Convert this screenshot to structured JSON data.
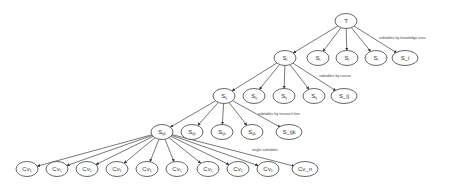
{
  "diagram": {
    "title": "",
    "root": {
      "id": "T",
      "label": "T",
      "x": 346,
      "y": 21
    },
    "levels": [
      {
        "annotation": "subtables by knowledge area",
        "annotation_pos": [
          379,
          39
        ],
        "parent": "T",
        "nodes": [
          {
            "id": "L1_0",
            "label": "S",
            "sub": "i",
            "x": 285,
            "y": 58
          },
          {
            "id": "L1_1",
            "label": "S",
            "sub": "i",
            "x": 318,
            "y": 58
          },
          {
            "id": "L1_2",
            "label": "S",
            "sub": "i",
            "x": 347,
            "y": 58
          },
          {
            "id": "L1_3",
            "label": "S",
            "sub": "i",
            "x": 376,
            "y": 58
          },
          {
            "id": "L1_4",
            "label": "S_i",
            "sub": "",
            "x": 405,
            "y": 58
          }
        ]
      },
      {
        "annotation": "subtables by course",
        "annotation_pos": [
          319,
          77
        ],
        "parent": "L1_0",
        "nodes": [
          {
            "id": "L2_0",
            "label": "S",
            "sub": "ij",
            "x": 224,
            "y": 96
          },
          {
            "id": "L2_1",
            "label": "S",
            "sub": "ij",
            "x": 254,
            "y": 96
          },
          {
            "id": "L2_2",
            "label": "S",
            "sub": "ij",
            "x": 284,
            "y": 96
          },
          {
            "id": "L2_3",
            "label": "S",
            "sub": "ij",
            "x": 314,
            "y": 96
          },
          {
            "id": "L2_4",
            "label": "S_ij",
            "sub": "",
            "x": 344,
            "y": 96
          }
        ]
      },
      {
        "annotation": "subtables by research line",
        "annotation_pos": [
          258,
          115
        ],
        "parent": "L2_0",
        "nodes": [
          {
            "id": "L3_0",
            "label": "S",
            "sub": "ijk",
            "x": 162,
            "y": 132
          },
          {
            "id": "L3_1",
            "label": "S",
            "sub": "ijk",
            "x": 192,
            "y": 132
          },
          {
            "id": "L3_2",
            "label": "S",
            "sub": "ijk",
            "x": 222,
            "y": 132
          },
          {
            "id": "L3_3",
            "label": "S",
            "sub": "ijk",
            "x": 252,
            "y": 132
          },
          {
            "id": "L3_4",
            "label": "S_ijk",
            "sub": "",
            "x": 289,
            "y": 132
          }
        ]
      },
      {
        "annotation": "single subtables",
        "annotation_pos": [
          252,
          151
        ],
        "parent": "L3_0",
        "nodes": [
          {
            "id": "L4_0",
            "label": "Cv",
            "sub": "1",
            "x": 27,
            "y": 169
          },
          {
            "id": "L4_1",
            "label": "Cv",
            "sub": "1",
            "x": 57,
            "y": 169
          },
          {
            "id": "L4_2",
            "label": "Cv",
            "sub": "1",
            "x": 87,
            "y": 169
          },
          {
            "id": "L4_3",
            "label": "Cv",
            "sub": "1",
            "x": 117,
            "y": 169
          },
          {
            "id": "L4_4",
            "label": "Cv",
            "sub": "1",
            "x": 147,
            "y": 169
          },
          {
            "id": "L4_5",
            "label": "Cv",
            "sub": "1",
            "x": 177,
            "y": 169
          },
          {
            "id": "L4_6",
            "label": "Cv",
            "sub": "1",
            "x": 208,
            "y": 169
          },
          {
            "id": "L4_7",
            "label": "Cv",
            "sub": "1",
            "x": 238,
            "y": 169
          },
          {
            "id": "L4_8",
            "label": "Cv",
            "sub": "1",
            "x": 268,
            "y": 169
          },
          {
            "id": "L4_9",
            "label": "Cv_n",
            "sub": "",
            "x": 305,
            "y": 169
          }
        ]
      }
    ],
    "colors": {
      "stroke": "#555555",
      "fill": "#ffffff",
      "text": "#333333"
    }
  }
}
